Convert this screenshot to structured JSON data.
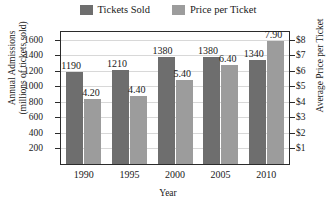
{
  "chart_data": {
    "type": "bar",
    "title": "",
    "xlabel": "Year",
    "categories": [
      "1990",
      "1995",
      "2000",
      "2005",
      "2010"
    ],
    "series": [
      {
        "name": "Tickets Sold",
        "axis": "left",
        "color": "#6e6e6e",
        "values": [
          1190,
          1210,
          1380,
          1380,
          1340
        ],
        "labels": [
          "1190",
          "1210",
          "1380",
          "1380",
          "1340"
        ]
      },
      {
        "name": "Price per Ticket",
        "axis": "right",
        "color": "#9c9c9c",
        "values": [
          4.2,
          4.4,
          5.4,
          6.4,
          7.9
        ],
        "labels": [
          "4.20",
          "4.40",
          "5.40",
          "6.40",
          "7.90"
        ]
      }
    ],
    "left_axis": {
      "title_line1": "Annual Admissions",
      "title_line2": "(millions of tickets sold)",
      "ticks": [
        "1600",
        "1400",
        "1200",
        "1000",
        "800",
        "600",
        "400",
        "200"
      ],
      "tick_values": [
        1600,
        1400,
        1200,
        1000,
        800,
        600,
        400,
        200
      ],
      "ylim": [
        0,
        1700
      ]
    },
    "right_axis": {
      "title": "Average Price per Ticket",
      "ticks": [
        "$8",
        "$7",
        "$6",
        "$5",
        "$4",
        "$3",
        "$2",
        "$1"
      ],
      "tick_values": [
        8,
        7,
        6,
        5,
        4,
        3,
        2,
        1
      ],
      "ylim": [
        0,
        8.5
      ]
    },
    "grid": true,
    "legend_position": "top-center"
  },
  "legend": {
    "items": [
      {
        "label": "Tickets Sold",
        "color": "#6e6e6e"
      },
      {
        "label": "Price per Ticket",
        "color": "#9c9c9c"
      }
    ]
  }
}
